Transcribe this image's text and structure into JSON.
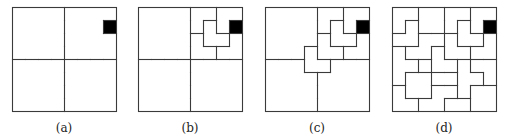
{
  "figure": {
    "grid_size": 8,
    "defect_cell": {
      "col": 7,
      "row": 1
    },
    "line_color": "#3a3a3a",
    "defect_color": "#000000",
    "panels": [
      {
        "label": "(a)",
        "description": "8x8 board divided into four quadrants; defective cell shaded",
        "regions": [
          "AAAABBBB",
          "AAAABBBX",
          "AAAABBBB",
          "AAAABBBB",
          "CCCCDDDD",
          "CCCCDDDD",
          "CCCCDDDD",
          "CCCCDDDD"
        ]
      },
      {
        "label": "(b)",
        "description": "Top-right quadrant tiled with L-trominoes",
        "regions": [
          "AAAAeeff",
          "AAAAegfX",
          "AAAAhggi",
          "AAAAhhii",
          "CCCCDDDD",
          "CCCCDDDD",
          "CCCCDDDD",
          "CCCCDDDD"
        ]
      },
      {
        "label": "(c)",
        "description": "Central L-tromino placed covering the other three quadrants' center cells",
        "regions": [
          "AAAAeeff",
          "AAAAegfX",
          "AAAAhggi",
          "AAAzhhii",
          "CCCzzDDD",
          "CCCCDDDD",
          "CCCCDDDD",
          "CCCCDDDD"
        ]
      },
      {
        "label": "(d)",
        "description": "Complete L-tromino tiling of the defective 8x8 board",
        "regions": [
          "aabbeeff",
          "acbbegfX",
          "ccddhggi",
          "kddzhhii",
          "kklzzmnn",
          "kppllmmn",
          "qpprrmss",
          "qqrrttss"
        ]
      }
    ]
  }
}
